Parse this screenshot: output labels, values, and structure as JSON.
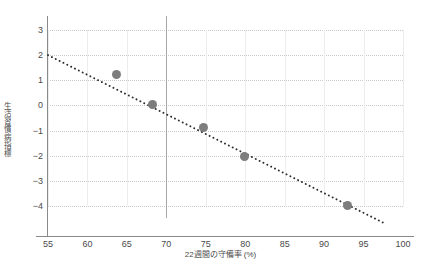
{
  "chart_data": {
    "type": "scatter",
    "title": "",
    "xlabel": "22週間の守備率 (%)",
    "ylabel": "生活習慣病指標",
    "xlim": [
      55,
      100
    ],
    "ylim": [
      -4,
      3
    ],
    "xticks": [
      55,
      60,
      65,
      70,
      75,
      80,
      85,
      90,
      95,
      100
    ],
    "yticks": [
      3,
      2,
      1,
      0,
      -1,
      -2,
      -3,
      -4
    ],
    "grid": true,
    "legend": "none",
    "marker_color": "#7d7d7d",
    "trendline_color": "#2b2b2b",
    "reference_line_color": "#a8a8a8",
    "gridline_color": "#c9c9c9",
    "points": [
      {
        "x": 63.7,
        "y": 1.22
      },
      {
        "x": 68.3,
        "y": 0.02
      },
      {
        "x": 74.7,
        "y": -0.88
      },
      {
        "x": 79.9,
        "y": -2.02
      },
      {
        "x": 93.0,
        "y": -3.98
      }
    ],
    "trendline": {
      "style": "dotted",
      "x_start": 55.0,
      "y_start": 2.0,
      "x_end": 97.6,
      "y_end": -4.68
    },
    "reference_line": {
      "orientation": "vertical",
      "x": 70
    }
  }
}
